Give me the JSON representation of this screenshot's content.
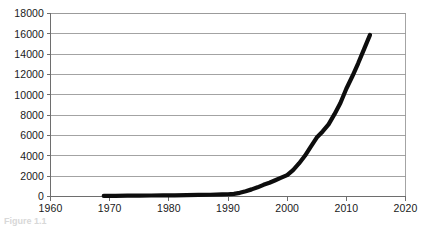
{
  "chart_data": {
    "type": "line",
    "title": "",
    "subtitle": "",
    "xlabel": "",
    "ylabel": "",
    "xlim": [
      1960,
      2020
    ],
    "ylim": [
      0,
      18000
    ],
    "grid": true,
    "legend": null,
    "legend_position": "none",
    "x_ticks": [
      "1960",
      "1970",
      "1980",
      "1990",
      "2000",
      "2010",
      "2020"
    ],
    "y_ticks": [
      "0",
      "2000",
      "4000",
      "6000",
      "8000",
      "10000",
      "12000",
      "14000",
      "16000",
      "18000"
    ],
    "series": [
      {
        "name": "series-1",
        "color": "#0d0d0d",
        "x": [
          1969,
          1971,
          1973,
          1975,
          1977,
          1979,
          1981,
          1983,
          1985,
          1987,
          1989,
          1990,
          1991,
          1992,
          1993,
          1994,
          1995,
          1996,
          1997,
          1998,
          1999,
          2000,
          2001,
          2002,
          2003,
          2004,
          2005,
          2006,
          2007,
          2008,
          2009,
          2010,
          2011,
          2012,
          2013,
          2014
        ],
        "values": [
          60,
          70,
          80,
          90,
          100,
          110,
          120,
          130,
          150,
          170,
          200,
          220,
          260,
          360,
          520,
          700,
          900,
          1150,
          1350,
          1600,
          1850,
          2100,
          2600,
          3250,
          4000,
          4900,
          5800,
          6400,
          7100,
          8100,
          9200,
          10600,
          11800,
          13100,
          14500,
          15900
        ]
      }
    ]
  },
  "caption": {
    "text": "Figure 1.1"
  }
}
